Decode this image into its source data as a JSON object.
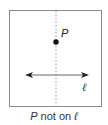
{
  "diagram": {
    "point_label": "P",
    "line_label": "ℓ",
    "caption": {
      "point": "P",
      "text": " not on ",
      "line": "ℓ"
    },
    "colors": {
      "frame": "#8a8a8a",
      "dotted_line": "#9a9a9a",
      "arrow_line": "#666666",
      "point": "#111111"
    }
  }
}
